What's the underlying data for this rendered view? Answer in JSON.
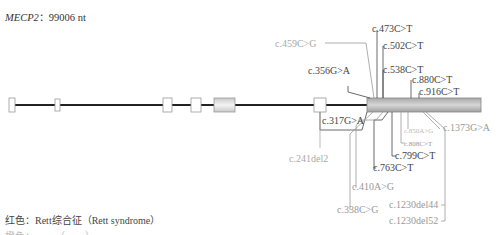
{
  "title": {
    "gene": "MECP2",
    "separator": "：",
    "length": "99006 nt"
  },
  "colors": {
    "dark": "#444444",
    "gray": "#a0a0a0",
    "light": "#b8b8b8"
  },
  "exons": [
    {
      "x": 9,
      "w": 6,
      "h": 13
    },
    {
      "x": 55,
      "w": 5,
      "h": 11
    },
    {
      "x": 163,
      "w": 9,
      "h": 13
    },
    {
      "x": 191,
      "w": 10,
      "h": 13
    },
    {
      "x": 214,
      "w": 21,
      "h": 13
    },
    {
      "x": 314,
      "w": 12,
      "h": 13
    },
    {
      "x": 367,
      "w": 114,
      "h": 13
    }
  ],
  "mutations": [
    {
      "label": "c.459C>G",
      "color": "gray"
    },
    {
      "label": "c.473C>T",
      "color": "dark"
    },
    {
      "label": "c.502C>T",
      "color": "dark"
    },
    {
      "label": "c.356G>A",
      "color": "dark"
    },
    {
      "label": "c.538C>T",
      "color": "dark"
    },
    {
      "label": "c.880C>T",
      "color": "dark"
    },
    {
      "label": "c.916C>T",
      "color": "dark"
    },
    {
      "label": "c.317G>A",
      "color": "dark"
    },
    {
      "label": "c.850A>G",
      "color": "light"
    },
    {
      "label": "c.1373G>A",
      "color": "gray"
    },
    {
      "label": "c.808C>T",
      "color": "gray"
    },
    {
      "label": "c.241del2",
      "color": "gray"
    },
    {
      "label": "c.799C>T",
      "color": "dark"
    },
    {
      "label": "c.763C>T",
      "color": "dark"
    },
    {
      "label": "c.410A>G",
      "color": "gray"
    },
    {
      "label": "c.1230del44",
      "color": "gray"
    },
    {
      "label": "c.338C>G",
      "color": "gray"
    },
    {
      "label": "c.1230del52",
      "color": "gray"
    }
  ],
  "legend": {
    "line1": "红色：Rett综合征（Rett syndrome）",
    "line2": "橙色：……（……）"
  }
}
